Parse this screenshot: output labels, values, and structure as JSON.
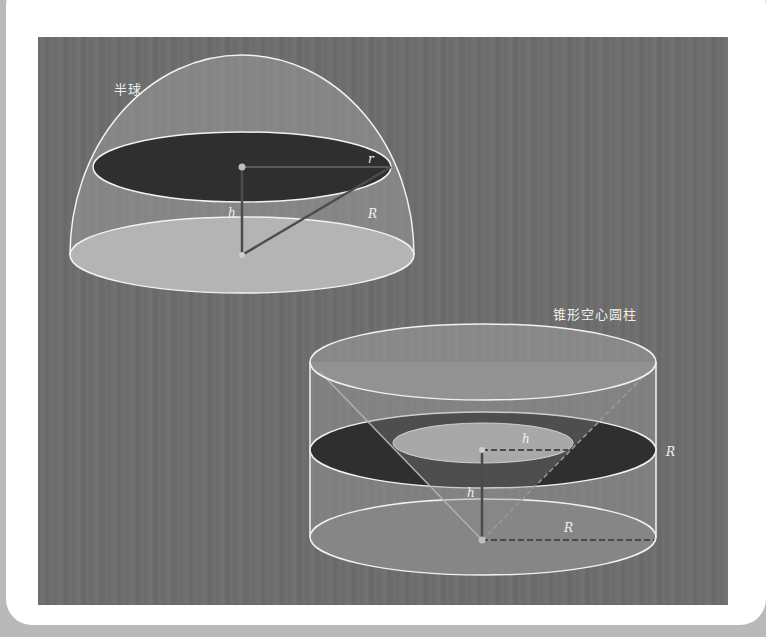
{
  "figures": [
    {
      "id": "hemisphere",
      "title": "半球",
      "labels": {
        "small_radius": "r",
        "height": "h",
        "big_radius": "R"
      }
    },
    {
      "id": "conical-hollow-cylinder",
      "title": "锥形空心圆柱",
      "labels": {
        "inner_radius": "h",
        "height": "h",
        "base_radius": "R",
        "side_radius": "R"
      }
    }
  ],
  "colors": {
    "background": "#6e6e6e",
    "outline": "#f0f0f0",
    "dark_section": "#2e2e2e",
    "light_base": "#bdbdbd",
    "line": "#505050"
  }
}
